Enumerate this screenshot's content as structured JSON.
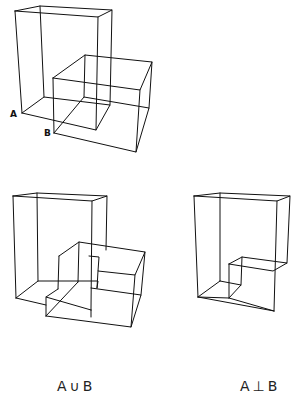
{
  "figure": {
    "top": {
      "label_a": "A",
      "label_b": "B"
    },
    "union": {
      "caption": "A∪B"
    },
    "difference": {
      "caption": "A⊥B"
    }
  },
  "colors": {
    "line": "#111111",
    "background": "#ffffff"
  }
}
